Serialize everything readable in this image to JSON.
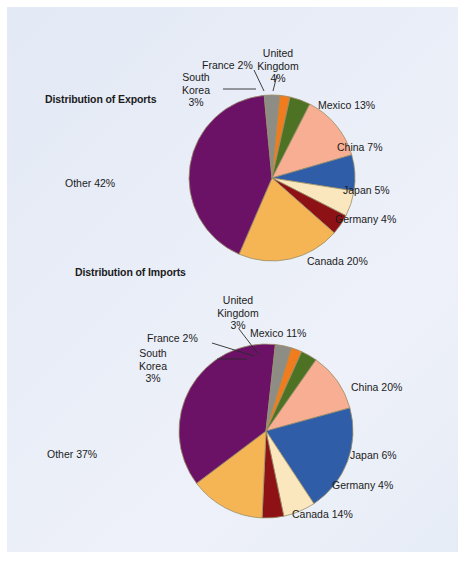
{
  "figure": {
    "background_color": "#e8edf7",
    "border_color": "#d6dcea"
  },
  "palette": {
    "mexico": "#F7AE92",
    "china": "#2F5DA8",
    "japan": "#FBE7BD",
    "germany": "#8E1116",
    "canada": "#F5B555",
    "other": "#6B1266",
    "south_korea": "#8D8D85",
    "france": "#F07C1E",
    "united_kingdom": "#4E7224",
    "outline": "#9a8f6a",
    "text": "#1b1b1b"
  },
  "charts": [
    {
      "id": "exports",
      "title": "Distribution of Exports",
      "type": "pie",
      "slices": [
        {
          "name": "Mexico",
          "label": "Mexico 13%",
          "value": 13,
          "color_key": "mexico"
        },
        {
          "name": "China",
          "label": "China 7%",
          "value": 7,
          "color_key": "china"
        },
        {
          "name": "Japan",
          "label": "Japan 5%",
          "value": 5,
          "color_key": "japan"
        },
        {
          "name": "Germany",
          "label": "Germany 4%",
          "value": 4,
          "color_key": "germany"
        },
        {
          "name": "Canada",
          "label": "Canada 20%",
          "value": 20,
          "color_key": "canada"
        },
        {
          "name": "Other",
          "label": "Other 42%",
          "value": 42,
          "color_key": "other"
        },
        {
          "name": "South Korea",
          "label": "South Korea 3%",
          "value": 3,
          "color_key": "south_korea"
        },
        {
          "name": "France",
          "label": "France 2%",
          "value": 2,
          "color_key": "france"
        },
        {
          "name": "United Kingdom",
          "label": "United Kingdom 4%",
          "value": 4,
          "color_key": "united_kingdom"
        }
      ],
      "labels": {
        "united_kingdom_l1": "United",
        "united_kingdom_l2": "Kingdom",
        "united_kingdom_l3": "4%",
        "france": "France 2%",
        "south_korea_l1": "South",
        "south_korea_l2": "Korea",
        "south_korea_l3": "3%",
        "mexico": "Mexico 13%",
        "china": "China 7%",
        "japan": "Japan 5%",
        "germany": "Germany 4%",
        "canada": "Canada 20%",
        "other": "Other 42%"
      }
    },
    {
      "id": "imports",
      "title": "Distribution of Imports",
      "type": "pie",
      "slices": [
        {
          "name": "Mexico",
          "label": "Mexico 11%",
          "value": 11,
          "color_key": "mexico"
        },
        {
          "name": "China",
          "label": "China 20%",
          "value": 20,
          "color_key": "china"
        },
        {
          "name": "Japan",
          "label": "Japan 6%",
          "value": 6,
          "color_key": "japan"
        },
        {
          "name": "Germany",
          "label": "Germany 4%",
          "value": 4,
          "color_key": "germany"
        },
        {
          "name": "Canada",
          "label": "Canada 14%",
          "value": 14,
          "color_key": "canada"
        },
        {
          "name": "Other",
          "label": "Other 37%",
          "value": 37,
          "color_key": "other"
        },
        {
          "name": "South Korea",
          "label": "South Korea 3%",
          "value": 3,
          "color_key": "south_korea"
        },
        {
          "name": "France",
          "label": "France 2%",
          "value": 2,
          "color_key": "france"
        },
        {
          "name": "United Kingdom",
          "label": "United Kingdom 3%",
          "value": 3,
          "color_key": "united_kingdom"
        }
      ],
      "labels": {
        "united_kingdom_l1": "United",
        "united_kingdom_l2": "Kingdom",
        "united_kingdom_l3": "3%",
        "france": "France 2%",
        "south_korea_l1": "South",
        "south_korea_l2": "Korea",
        "south_korea_l3": "3%",
        "mexico": "Mexico 11%",
        "china": "China 20%",
        "japan": "Japan 6%",
        "germany": "Germany 4%",
        "canada": "Canada 14%",
        "other": "Other 37%"
      }
    }
  ],
  "chart_data": [
    {
      "type": "pie",
      "title": "Distribution of Exports",
      "categories": [
        "Mexico",
        "China",
        "Japan",
        "Germany",
        "Canada",
        "Other",
        "South Korea",
        "France",
        "United Kingdom"
      ],
      "values": [
        13,
        7,
        5,
        4,
        20,
        42,
        3,
        2,
        4
      ],
      "unit": "percent",
      "data_labels": [
        "Mexico 13%",
        "China 7%",
        "Japan 5%",
        "Germany 4%",
        "Canada 20%",
        "Other 42%",
        "South Korea 3%",
        "France 2%",
        "United Kingdom 4%"
      ],
      "colors": [
        "#F7AE92",
        "#2F5DA8",
        "#FBE7BD",
        "#8E1116",
        "#F5B555",
        "#6B1266",
        "#8D8D85",
        "#F07C1E",
        "#4E7224"
      ],
      "legend": "none",
      "grid": false,
      "start_angle_deg": -63,
      "direction": "clockwise"
    },
    {
      "type": "pie",
      "title": "Distribution of Imports",
      "categories": [
        "Mexico",
        "China",
        "Japan",
        "Germany",
        "Canada",
        "Other",
        "South Korea",
        "France",
        "United Kingdom"
      ],
      "values": [
        11,
        20,
        6,
        4,
        14,
        37,
        3,
        2,
        3
      ],
      "unit": "percent",
      "data_labels": [
        "Mexico 11%",
        "China 20%",
        "Japan 6%",
        "Germany 4%",
        "Canada 14%",
        "Other 37%",
        "South Korea 3%",
        "France 2%",
        "United Kingdom 3%"
      ],
      "colors": [
        "#F7AE92",
        "#2F5DA8",
        "#FBE7BD",
        "#8E1116",
        "#F5B555",
        "#6B1266",
        "#8D8D85",
        "#F07C1E",
        "#4E7224"
      ],
      "legend": "none",
      "grid": false,
      "start_angle_deg": -55,
      "direction": "clockwise"
    }
  ]
}
